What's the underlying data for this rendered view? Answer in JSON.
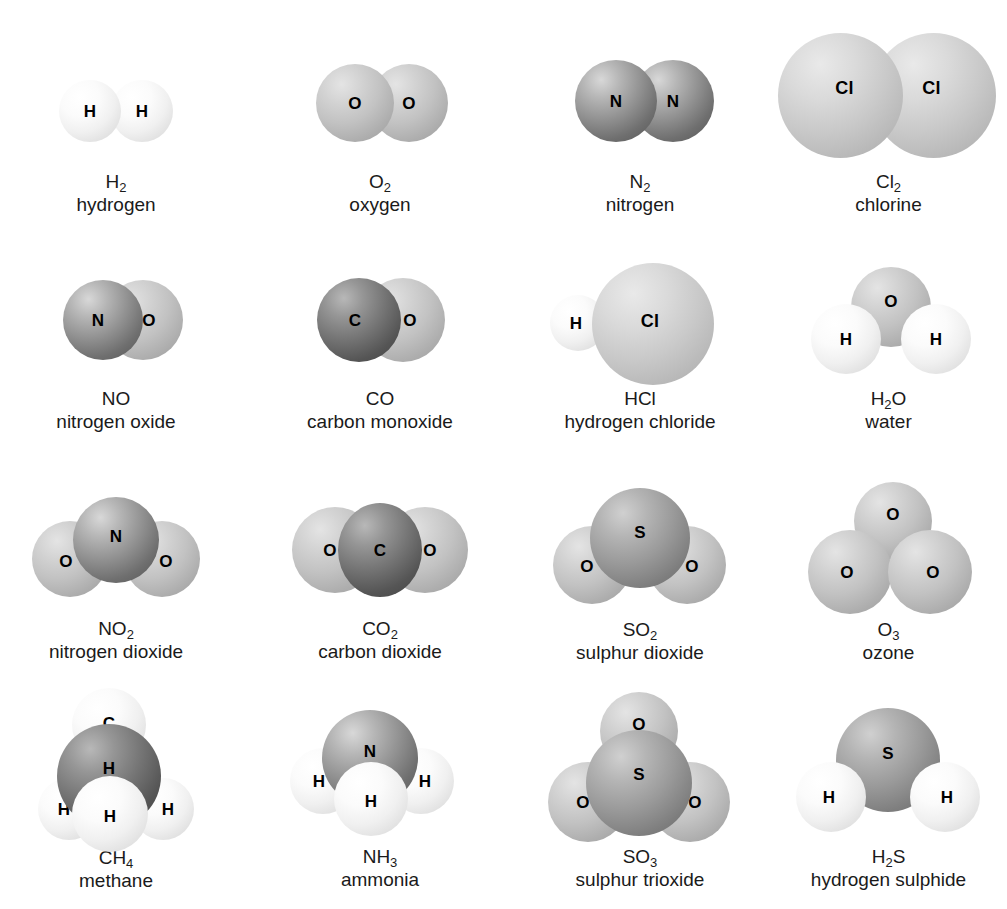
{
  "figure": {
    "type": "molecular-model-chart",
    "columns": 4,
    "rows": 4
  },
  "element_colors": {
    "H": "#f5f5f5",
    "O": "#c2c2c2",
    "Cl": "#c9c9c9",
    "N": "#949494",
    "S": "#9a9a9a",
    "C": "#757575"
  },
  "molecules": [
    {
      "id": "h2",
      "formula": "H",
      "subscript": "2",
      "name": "hydrogen",
      "atoms": [
        {
          "label": "H",
          "element": "H"
        },
        {
          "label": "H",
          "element": "H"
        }
      ]
    },
    {
      "id": "o2",
      "formula": "O",
      "subscript": "2",
      "name": "oxygen",
      "atoms": [
        {
          "label": "O",
          "element": "O"
        },
        {
          "label": "O",
          "element": "O"
        }
      ]
    },
    {
      "id": "n2",
      "formula": "N",
      "subscript": "2",
      "name": "nitrogen",
      "atoms": [
        {
          "label": "N",
          "element": "N"
        },
        {
          "label": "N",
          "element": "N"
        }
      ]
    },
    {
      "id": "cl2",
      "formula": "Cl",
      "subscript": "2",
      "name": "chlorine",
      "atoms": [
        {
          "label": "Cl",
          "element": "Cl"
        },
        {
          "label": "Cl",
          "element": "Cl"
        }
      ]
    },
    {
      "id": "no",
      "formula": "NO",
      "subscript": "",
      "name": "nitrogen oxide",
      "atoms": [
        {
          "label": "N",
          "element": "N"
        },
        {
          "label": "O",
          "element": "O"
        }
      ]
    },
    {
      "id": "co",
      "formula": "CO",
      "subscript": "",
      "name": "carbon monoxide",
      "atoms": [
        {
          "label": "C",
          "element": "C"
        },
        {
          "label": "O",
          "element": "O"
        }
      ]
    },
    {
      "id": "hcl",
      "formula": "HCl",
      "subscript": "",
      "name": "hydrogen chloride",
      "atoms": [
        {
          "label": "H",
          "element": "H"
        },
        {
          "label": "Cl",
          "element": "Cl"
        }
      ]
    },
    {
      "id": "h2o",
      "formula": "H",
      "subscript": "2",
      "formula_tail": "O",
      "name": "water",
      "atoms": [
        {
          "label": "O",
          "element": "O"
        },
        {
          "label": "H",
          "element": "H"
        },
        {
          "label": "H",
          "element": "H"
        }
      ]
    },
    {
      "id": "no2",
      "formula": "NO",
      "subscript": "2",
      "name": "nitrogen dioxide",
      "atoms": [
        {
          "label": "O",
          "element": "O"
        },
        {
          "label": "O",
          "element": "O"
        },
        {
          "label": "N",
          "element": "N"
        }
      ]
    },
    {
      "id": "co2",
      "formula": "CO",
      "subscript": "2",
      "name": "carbon dioxide",
      "atoms": [
        {
          "label": "O",
          "element": "O"
        },
        {
          "label": "O",
          "element": "O"
        },
        {
          "label": "C",
          "element": "C"
        }
      ]
    },
    {
      "id": "so2",
      "formula": "SO",
      "subscript": "2",
      "name": "sulphur dioxide",
      "atoms": [
        {
          "label": "O",
          "element": "O"
        },
        {
          "label": "O",
          "element": "O"
        },
        {
          "label": "S",
          "element": "S"
        }
      ]
    },
    {
      "id": "o3",
      "formula": "O",
      "subscript": "3",
      "name": "ozone",
      "atoms": [
        {
          "label": "O",
          "element": "O"
        },
        {
          "label": "O",
          "element": "O"
        },
        {
          "label": "O",
          "element": "O"
        }
      ]
    },
    {
      "id": "ch4",
      "formula": "CH",
      "subscript": "4",
      "name": "methane",
      "atoms": [
        {
          "label": "H",
          "element": "H"
        },
        {
          "label": "H",
          "element": "H"
        },
        {
          "label": "C",
          "element": "C"
        },
        {
          "label": "H",
          "element": "H"
        },
        {
          "label": "H",
          "element": "H"
        }
      ]
    },
    {
      "id": "nh3",
      "formula": "NH",
      "subscript": "3",
      "name": "ammonia",
      "atoms": [
        {
          "label": "H",
          "element": "H"
        },
        {
          "label": "H",
          "element": "H"
        },
        {
          "label": "N",
          "element": "N"
        },
        {
          "label": "H",
          "element": "H"
        }
      ]
    },
    {
      "id": "so3",
      "formula": "SO",
      "subscript": "3",
      "name": "sulphur trioxide",
      "atoms": [
        {
          "label": "O",
          "element": "O"
        },
        {
          "label": "O",
          "element": "O"
        },
        {
          "label": "O",
          "element": "O"
        },
        {
          "label": "S",
          "element": "S"
        }
      ]
    },
    {
      "id": "h2s",
      "formula": "H",
      "subscript": "2",
      "formula_tail": "S",
      "name": "hydrogen sulphide",
      "atoms": [
        {
          "label": "S",
          "element": "S"
        },
        {
          "label": "H",
          "element": "H"
        },
        {
          "label": "H",
          "element": "H"
        }
      ]
    }
  ]
}
